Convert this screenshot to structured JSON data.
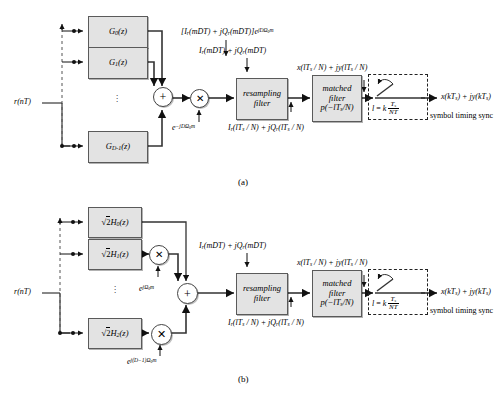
{
  "figure": {
    "caption_a": "(a)",
    "caption_b": "(b)"
  },
  "diagram_a": {
    "input_label": "r(nT)",
    "filters": [
      {
        "name": "G0",
        "label": "G₀(z)"
      },
      {
        "name": "G1",
        "label": "G₁(z)"
      },
      {
        "name": "GDm1",
        "label": "G₀₋₁(z)"
      }
    ],
    "filter_labels": {
      "g0": "G",
      "g0_sub": "0",
      "g0_tail": "(z)",
      "g1_sub": "1",
      "gd_sub": "D-1"
    },
    "vertical_dots": "⋮",
    "adder_symbol": "+",
    "multiplier_symbol": "✕",
    "mixer_label_prefix": "e",
    "mixer_label_exp": "−jDΩ₀m",
    "top_signal_label": "[Iᵣ(mDT) + jQᵣ(mDT)]e^{jDΩ₀m}",
    "resampler_in_label": "Iᵣ(mDT) + jQᵣ(mDT)",
    "resampling_filter_line1": "resampling",
    "resampling_filter_line2": "filter",
    "resampler_out_label": "Iᵣ(lTₛ / N) + jQᵣ(lTₛ / N)",
    "matched_filter_line1": "matched",
    "matched_filter_line2": "filter",
    "matched_filter_line3": "p(−lTₛ/N)",
    "matched_out_label": "x(lTₛ / N) + jy(lTₛ / N)",
    "sampler_rate_label": "l = k Tₛ / NT",
    "sync_caption": "symbol timing sync",
    "output_label": "x(kTₛ) + jy(kTₛ)"
  },
  "diagram_b": {
    "input_label": "r(nT)",
    "filters": [
      {
        "name": "H0",
        "label": "√2H₀(z)"
      },
      {
        "name": "H1",
        "label": "√2H₁(z)"
      },
      {
        "name": "H2",
        "label": "√2H₂(z)"
      }
    ],
    "vertical_dots": "⋮",
    "adder_symbol": "+",
    "multiplier_symbol": "✕",
    "mixer1_exp": "jΩ₀m",
    "mixer2_exp": "j(D−1)Ω₀m",
    "mixer_base": "e",
    "resampler_in_label": "Iᵣ(mDT) + jQᵣ(mDT)",
    "resampling_filter_line1": "resampling",
    "resampling_filter_line2": "filter",
    "resampler_out_label": "Iᵣ(lTₛ / N) + jQᵣ(lTₛ / N)",
    "matched_filter_line1": "matched",
    "matched_filter_line2": "filter",
    "matched_filter_line3": "p(−lTₛ/N)",
    "matched_out_label": "x(lTₛ / N) + jy(lTₛ / N)",
    "sampler_rate_label": "l = k Tₛ / NT",
    "sync_caption": "symbol timing sync",
    "output_label": "x(kTₛ) + jy(kTₛ)"
  },
  "colors": {
    "block_fill": "#e3e3e3",
    "block_stroke": "#5a5a5a",
    "line": "#1a1a1a",
    "dashed": "#222222",
    "background": "#ffffff"
  }
}
